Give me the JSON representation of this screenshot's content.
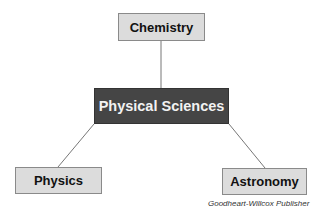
{
  "diagram": {
    "type": "concept-map",
    "root": {
      "label": "Physical Sciences",
      "color": "#454545"
    },
    "nodes": [
      {
        "id": "chemistry",
        "label": "Chemistry",
        "position": "top"
      },
      {
        "id": "physics",
        "label": "Physics",
        "position": "bottom-left"
      },
      {
        "id": "astronomy",
        "label": "Astronomy",
        "position": "bottom-right"
      }
    ],
    "edges": [
      {
        "from": "Physical Sciences",
        "to": "Chemistry"
      },
      {
        "from": "Physical Sciences",
        "to": "Physics"
      },
      {
        "from": "Physical Sciences",
        "to": "Astronomy"
      }
    ],
    "leaf_color": "#dcdcdc"
  },
  "credit": "Goodheart-Willcox Publisher"
}
